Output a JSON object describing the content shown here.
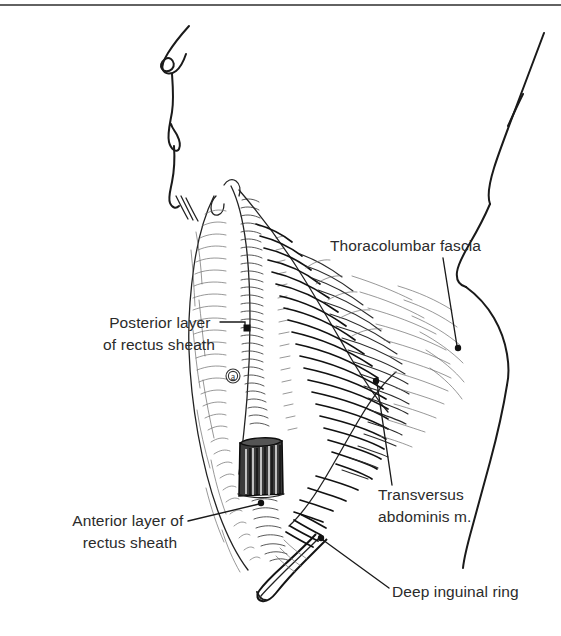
{
  "page": {
    "background_color": "#ffffff",
    "width": 561,
    "height": 636,
    "top_rule_color": "#2e2e2e"
  },
  "figure": {
    "name": "abdominal-wall-anatomy",
    "ink_color": "#1a1a1a",
    "label_text_color": "#2b2b2b",
    "inline_marker": {
      "name": "circled-letter-a",
      "letter": "a",
      "x": 233,
      "y": 376
    }
  },
  "labels": [
    {
      "id": "posterior-layer-rectus-sheath",
      "lines": [
        "Posterior layer",
        "of rectus sheath"
      ],
      "align": "end",
      "text_x": 215,
      "text_y": 328,
      "line_height": 22,
      "leader": "M 220 322 L 245 322 L 245 328",
      "marker": {
        "type": "square",
        "x": 247,
        "y": 328,
        "size": 7
      }
    },
    {
      "id": "anterior-layer-rectus-sheath",
      "lines": [
        "Anterior layer of",
        "rectus sheath"
      ],
      "align": "middle",
      "text_x": 130,
      "text_y": 526,
      "line_height": 22,
      "leader": "M 188 521 L 259 504",
      "marker": {
        "type": "dot",
        "x": 261,
        "y": 503,
        "size": 3.2
      }
    },
    {
      "id": "thoracolumbar-fascia",
      "lines": [
        "Thoracolumbar fascia"
      ],
      "align": "start",
      "text_x": 330,
      "text_y": 251,
      "line_height": 22,
      "leader": "M 443 258 L 457 346",
      "marker": {
        "type": "dot",
        "x": 458,
        "y": 348,
        "size": 3.2
      }
    },
    {
      "id": "transversus-abdominis-muscle",
      "lines": [
        "Transversus",
        "abdominis m."
      ],
      "align": "start",
      "text_x": 378,
      "text_y": 500,
      "line_height": 22,
      "leader": "M 392 485 L 377 383",
      "marker": {
        "type": "dot",
        "x": 376,
        "y": 381,
        "size": 3.2
      }
    },
    {
      "id": "deep-inguinal-ring",
      "lines": [
        "Deep inguinal ring"
      ],
      "align": "start",
      "text_x": 392,
      "text_y": 597,
      "line_height": 22,
      "leader": "M 389 588 L 323 540",
      "marker": {
        "type": "dot",
        "x": 321,
        "y": 538,
        "size": 3.2
      }
    }
  ]
}
